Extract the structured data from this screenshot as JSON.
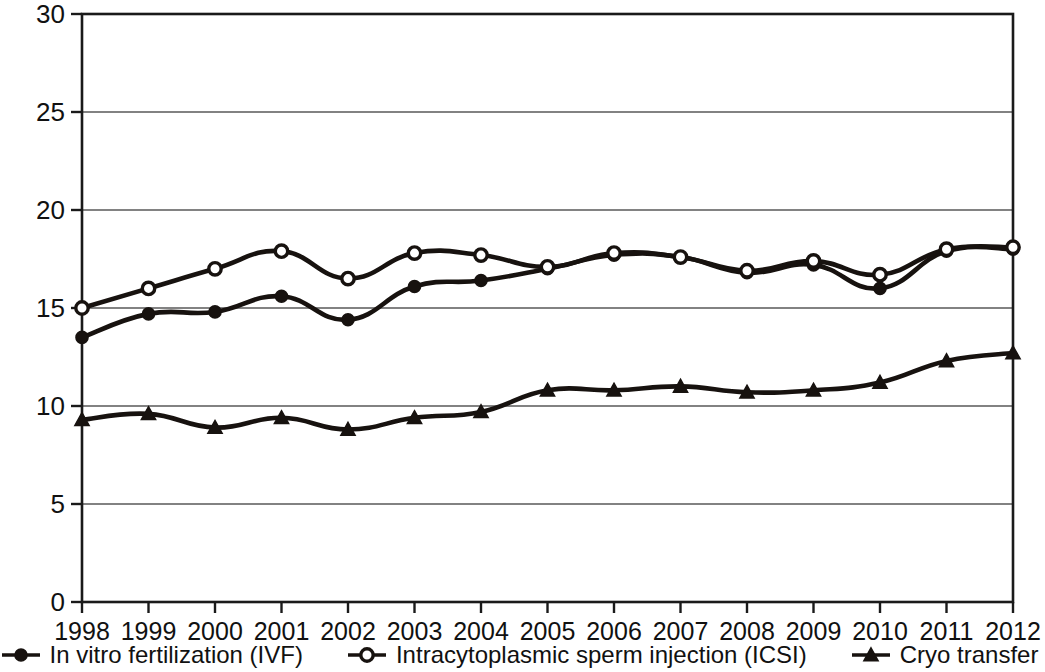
{
  "chart_data": {
    "type": "line",
    "title": "",
    "xlabel": "",
    "ylabel": "Live births per treatment cycle (in %)",
    "categories": [
      "1998",
      "1999",
      "2000",
      "2001",
      "2002",
      "2003",
      "2004",
      "2005",
      "2006",
      "2007",
      "2008",
      "2009",
      "2010",
      "2011",
      "2012"
    ],
    "x_tick_labels": [
      "1998",
      "1999",
      "2000",
      "2001",
      "2002",
      "2003",
      "2004",
      "2005",
      "2006",
      "2007",
      "2008",
      "2009",
      "2010",
      "2011",
      "2012"
    ],
    "y_tick_labels": [
      "0",
      "5",
      "10",
      "15",
      "20",
      "25",
      "30"
    ],
    "y_ticks": [
      0,
      5,
      10,
      15,
      20,
      25,
      30
    ],
    "ylim": [
      0,
      30
    ],
    "grid": "horizontal",
    "legend_position": "bottom",
    "series": [
      {
        "name": "In vitro fertilization (IVF)",
        "marker": "filled-circle",
        "color": "#17120f",
        "values": [
          13.5,
          14.7,
          14.8,
          15.6,
          14.4,
          16.1,
          16.4,
          17.0,
          17.7,
          17.6,
          16.8,
          17.2,
          16.0,
          17.9,
          18.0
        ]
      },
      {
        "name": "Intracytoplasmic sperm injection (ICSI)",
        "marker": "open-circle",
        "color": "#17120f",
        "values": [
          15.0,
          16.0,
          17.0,
          17.9,
          16.5,
          17.8,
          17.7,
          17.1,
          17.8,
          17.6,
          16.9,
          17.4,
          16.7,
          18.0,
          18.1
        ]
      },
      {
        "name": "Cryo transfer",
        "marker": "filled-triangle",
        "color": "#17120f",
        "values": [
          9.3,
          9.6,
          8.9,
          9.4,
          8.8,
          9.4,
          9.7,
          10.8,
          10.8,
          11.0,
          10.7,
          10.8,
          11.2,
          12.3,
          12.7
        ]
      }
    ]
  },
  "axis": {
    "y_title": "Live births per treatment cycle (in %)"
  },
  "legend": {
    "items": [
      {
        "label": "In vitro fertilization (IVF)",
        "marker": "filled-circle"
      },
      {
        "label": "Intracytoplasmic sperm injection (ICSI)",
        "marker": "open-circle"
      },
      {
        "label": "Cryo transfer",
        "marker": "filled-triangle"
      }
    ]
  }
}
